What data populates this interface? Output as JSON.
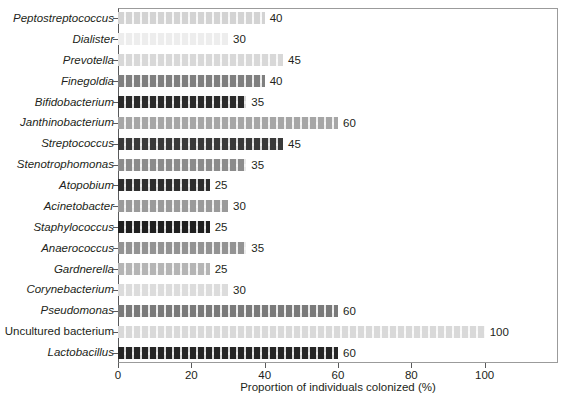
{
  "chart_data": {
    "type": "bar",
    "orientation": "horizontal",
    "title": "",
    "xlabel": "Proportion of individuals colonized (%)",
    "ylabel": "",
    "xlim": [
      0,
      120
    ],
    "xticks": [
      0,
      20,
      40,
      60,
      80,
      100
    ],
    "grid": false,
    "legend": null,
    "categories": [
      "Peptostreptococcus",
      "Dialister",
      "Prevotella",
      "Finegoldia",
      "Bifidobacterium",
      "Janthinobacterium",
      "Streptococcus",
      "Stenotrophomonas",
      "Atopobium",
      "Acinetobacter",
      "Staphylococcus",
      "Anaerococcus",
      "Gardnerella",
      "Corynebacterium",
      "Pseudomonas",
      "Uncultured bacterium",
      "Lactobacillus"
    ],
    "values": [
      40,
      30,
      45,
      40,
      35,
      60,
      45,
      35,
      25,
      30,
      25,
      35,
      25,
      30,
      60,
      100,
      60
    ],
    "value_labels": [
      "40",
      "30",
      "45",
      "40",
      "35",
      "60",
      "45",
      "35",
      "25",
      "30",
      "25",
      "35",
      "25",
      "30",
      "60",
      "100",
      "60"
    ],
    "bar_colors": [
      "#d3d3d3",
      "#ededed",
      "#d8d8d8",
      "#7f7f7f",
      "#2b2b2b",
      "#a6a6a6",
      "#3a3a3a",
      "#8c8c8c",
      "#2f2f2f",
      "#9a9a9a",
      "#1f1f1f",
      "#939393",
      "#b5b5b5",
      "#dcdcdc",
      "#7a7a7a",
      "#d9d9d9",
      "#262626"
    ],
    "label_styles": [
      "italic",
      "italic",
      "italic",
      "italic",
      "italic",
      "italic",
      "italic",
      "italic",
      "italic",
      "italic",
      "italic",
      "italic",
      "italic",
      "italic",
      "italic",
      "upright",
      "italic"
    ]
  },
  "axis": {
    "x_tick_labels": [
      "0",
      "20",
      "40",
      "60",
      "80",
      "100"
    ],
    "x_title": "Proportion of individuals colonized (%)"
  },
  "caption": {
    "sliver_text": ""
  }
}
